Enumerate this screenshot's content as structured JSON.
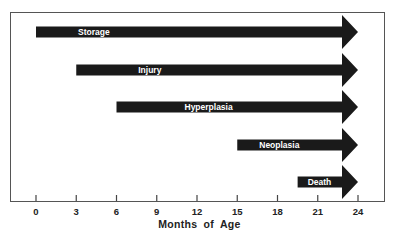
{
  "chart_data": {
    "type": "bar",
    "subtype": "horizontal-arrow-timeline",
    "title": "",
    "xlabel": "Months of Age",
    "ylabel": "",
    "xlim": [
      0,
      24
    ],
    "x_ticks": [
      0,
      3,
      6,
      9,
      12,
      15,
      18,
      21,
      24
    ],
    "grid": false,
    "legend": null,
    "series": [
      {
        "name": "Storage",
        "start": 0,
        "end": 24
      },
      {
        "name": "Injury",
        "start": 3,
        "end": 24
      },
      {
        "name": "Hyperplasia",
        "start": 6,
        "end": 24
      },
      {
        "name": "Neoplasia",
        "start": 15,
        "end": 24
      },
      {
        "name": "Death",
        "start": 19.5,
        "end": 24
      }
    ],
    "colors": {
      "bar": "#1a1a1a",
      "text": "#ffffff",
      "axis": "#555555"
    }
  }
}
